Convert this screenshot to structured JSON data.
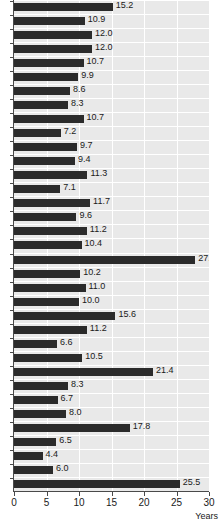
{
  "chart_data": {
    "type": "bar",
    "orientation": "horizontal",
    "title": "",
    "xlabel": "Years",
    "ylabel": "",
    "xlim": [
      0,
      30
    ],
    "xticks": [
      0,
      5,
      10,
      15,
      20,
      25,
      30
    ],
    "xticklabels": [
      "0",
      "5",
      "10",
      "15",
      "20",
      "25",
      "30"
    ],
    "grid": "vertical-and-horizontal-white-on-gray",
    "legend": "none",
    "categories": [
      "1",
      "2",
      "3",
      "4",
      "5",
      "6",
      "7",
      "8",
      "9",
      "10",
      "11",
      "12",
      "13",
      "14",
      "15",
      "16",
      "17",
      "18",
      "19",
      "20",
      "21",
      "22",
      "23",
      "24",
      "25",
      "26",
      "27",
      "28",
      "29",
      "30",
      "31",
      "32",
      "33",
      "34",
      "35"
    ],
    "values": [
      15.2,
      10.9,
      12.0,
      12.0,
      10.7,
      9.9,
      8.6,
      8.3,
      10.7,
      7.2,
      9.7,
      9.4,
      11.3,
      7.1,
      11.7,
      9.6,
      11.2,
      10.4,
      27.9,
      10.2,
      11.0,
      10.0,
      15.6,
      11.2,
      6.6,
      10.5,
      21.4,
      8.3,
      6.7,
      8.0,
      17.8,
      6.5,
      4.4,
      6.0,
      25.5
    ],
    "datalabels": [
      "15.2",
      "10.9",
      "12.0",
      "12.0",
      "10.7",
      "9.9",
      "8.6",
      "8.3",
      "10.7",
      "7.2",
      "9.7",
      "9.4",
      "11.3",
      "7.1",
      "11.7",
      "9.6",
      "11.2",
      "10.4",
      "27.9",
      "10.2",
      "11.0",
      "10.0",
      "15.6",
      "11.2",
      "6.6",
      "10.5",
      "21.4",
      "8.3",
      "6.7",
      "8.0",
      "17.8",
      "6.5",
      "4.4",
      "6.0",
      "25.5"
    ],
    "colors": {
      "bar": "#2b2b2b",
      "plot_background": "#e9e9e9",
      "gridline": "#ffffff",
      "axis": "#4a4a4a",
      "text": "#1a1a1a",
      "page_background": "#ffffff"
    }
  }
}
